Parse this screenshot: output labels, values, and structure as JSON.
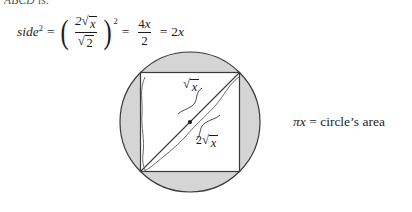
{
  "page": {
    "clipped_header": "ABCD is:",
    "background_color": "#ffffff",
    "ink_color": "#1c1c1c",
    "shade_color": "#d5d5d5"
  },
  "equation": {
    "lhs_base": "side",
    "lhs_exponent": "2",
    "equals_1": "=",
    "paren_open": "(",
    "paren_close": ")",
    "paren_exponent": "2",
    "inner_num_coefficient": "2",
    "inner_num_radicand": "x",
    "inner_den_radicand": "2",
    "radical_sign": "√",
    "equals_2": "=",
    "frac2_num_coefficient": "4",
    "frac2_num_variable": "x",
    "frac2_den": "2",
    "equals_3": "=",
    "result_coefficient": "2",
    "result_variable": "x"
  },
  "diagram": {
    "name": "circle-with-inscribed-square",
    "radius_label_coefficient": "",
    "radius_label_radical": "√",
    "radius_label_radicand": "x",
    "diameter_label_coefficient": "2",
    "diameter_label_radical": "√",
    "diameter_label_radicand": "x",
    "circle_fill": "#d5d5d5",
    "square_fill": "#ffffff",
    "stroke": "#3a3a3a",
    "center_dot": "•"
  },
  "caption": {
    "pi_symbol": "π",
    "variable": "x",
    "equals": "=",
    "text": "circle’s area"
  }
}
